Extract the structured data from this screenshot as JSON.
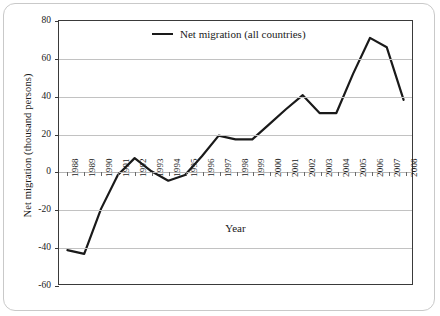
{
  "chart_data": {
    "type": "line",
    "title": "",
    "xlabel": "Year",
    "ylabel": "Net migration (thousand persons)",
    "categories": [
      "1988",
      "1989",
      "1990",
      "1991",
      "1992",
      "1993",
      "1994",
      "1995",
      "1996",
      "1997",
      "1998",
      "1999",
      "2000",
      "2001",
      "2002",
      "2003",
      "2004",
      "2005",
      "2006",
      "2007",
      "2008"
    ],
    "series": [
      {
        "name": "Net migration (all countries)",
        "values": [
          -42,
          -44,
          -20,
          -2,
          7,
          0,
          -5,
          -2,
          8,
          19,
          17,
          17,
          25,
          33,
          40.5,
          31,
          31,
          52,
          71,
          66,
          38
        ],
        "color": "#1a1a1a"
      }
    ],
    "ylim": [
      -60,
      80
    ],
    "yticks": [
      80,
      60,
      40,
      20,
      0,
      -20,
      -40,
      -60
    ],
    "ytick_labels": [
      "80",
      "60",
      "40",
      "20",
      "0",
      "-20",
      "-40",
      "-60"
    ],
    "grid": "horizontal",
    "legend_position": "top-center",
    "xtick_rotation": 90
  },
  "legend": {
    "entries": [
      {
        "label": "Net migration (all countries)",
        "swatch": "line-swatch"
      }
    ]
  },
  "axes": {
    "y_title": "Net migration (thousand persons)",
    "x_title": "Year"
  },
  "colors": {
    "series_line": "#1a1a1a",
    "gridline": "#c2c2c2",
    "plot_border": "#3a3a3a",
    "outer_border": "#c9c9c9",
    "background": "#ffffff",
    "text": "#1a1a1a"
  }
}
